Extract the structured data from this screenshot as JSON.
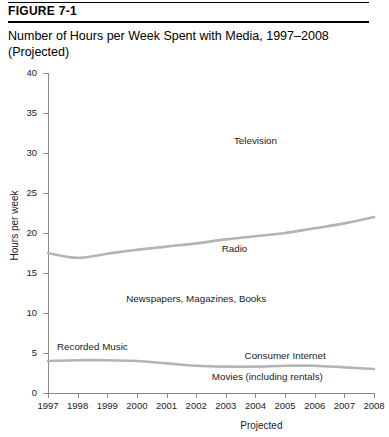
{
  "figure": {
    "label": "FIGURE 7-1",
    "title": "Number of Hours per Week Spent with Media, 1997–2008 (Projected)"
  },
  "axes": {
    "ylabel": "Hours per week",
    "xnote": "Projected"
  },
  "chart_data": {
    "type": "line",
    "title": "Number of Hours per Week Spent with Media, 1997–2008 (Projected)",
    "xlabel": "",
    "ylabel": "Hours per week",
    "xlim": [
      1997,
      2008
    ],
    "ylim": [
      0,
      40
    ],
    "yticks": [
      0,
      5,
      10,
      15,
      20,
      25,
      30,
      35,
      40
    ],
    "grid": false,
    "legend": "inline-labels",
    "x": [
      1997,
      1998,
      1999,
      2000,
      2001,
      2002,
      2003,
      2004,
      2005,
      2006,
      2007,
      2008
    ],
    "categories": [
      "1997",
      "1998",
      "1999",
      "2000",
      "2001",
      "2002",
      "2003",
      "2004",
      "2005",
      "2006",
      "2007",
      "2008"
    ],
    "series": [
      {
        "name": "Radio",
        "values": [
          17.5,
          16.9,
          17.4,
          17.9,
          18.3,
          18.7,
          19.2,
          19.6,
          20.0,
          20.6,
          21.2,
          22.0
        ]
      },
      {
        "name": "Recorded Music",
        "values": [
          4.0,
          4.1,
          4.1,
          4.0,
          3.7,
          3.4,
          3.3,
          3.3,
          3.4,
          3.4,
          3.2,
          3.0
        ]
      }
    ],
    "annotations": [
      {
        "text": "Television",
        "x": 2004,
        "y": 31.5
      },
      {
        "text": "Radio",
        "x": 2003.3,
        "y": 18.0
      },
      {
        "text": "Newspapers, Magazines, Books",
        "x": 2002,
        "y": 11.8
      },
      {
        "text": "Recorded Music",
        "x": 1998.5,
        "y": 5.8
      },
      {
        "text": "Consumer Internet",
        "x": 2005,
        "y": 4.6
      },
      {
        "text": "Movies (including rentals)",
        "x": 2004.4,
        "y": 2.0
      }
    ]
  },
  "ytick_labels": [
    "40",
    "35",
    "30",
    "25",
    "20",
    "15",
    "10",
    "5",
    "0"
  ],
  "xtick_labels": [
    "1997",
    "1998",
    "1999",
    "2000",
    "2001",
    "2002",
    "2003",
    "2004",
    "2005",
    "2006",
    "2007",
    "2008"
  ],
  "colors": {
    "line": "#b4b4b4",
    "axis": "#8a8a8a",
    "text": "#000000"
  }
}
